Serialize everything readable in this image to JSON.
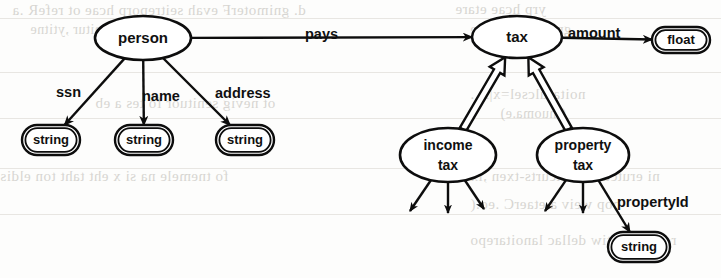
{
  "diagram": {
    "ink_color": "#0d0d0d",
    "paper_color": "#fdfdfc",
    "bleed_color": "#b9b6b0",
    "nodes": [
      {
        "id": "person",
        "label": "person",
        "shape": "ellipse",
        "kind": "entity",
        "cx": 143,
        "cy": 38,
        "rx": 48,
        "ry": 22
      },
      {
        "id": "tax",
        "label": "tax",
        "shape": "ellipse",
        "kind": "entity",
        "cx": 517,
        "cy": 37,
        "rx": 45,
        "ry": 21
      },
      {
        "id": "incometax",
        "label": "income tax",
        "shape": "ellipse",
        "kind": "entity",
        "cx": 448,
        "cy": 155,
        "rx": 48,
        "ry": 27
      },
      {
        "id": "propertytax",
        "label": "property tax",
        "shape": "ellipse",
        "kind": "entity",
        "cx": 583,
        "cy": 155,
        "rx": 46,
        "ry": 27
      },
      {
        "id": "float",
        "label": "float",
        "shape": "stadium",
        "kind": "basetype",
        "cx": 681,
        "cy": 40,
        "rx": 29,
        "ry": 13
      },
      {
        "id": "string1",
        "label": "string",
        "shape": "stadium",
        "kind": "basetype",
        "cx": 51,
        "cy": 140,
        "rx": 29,
        "ry": 15
      },
      {
        "id": "string2",
        "label": "string",
        "shape": "stadium",
        "kind": "basetype",
        "cx": 144,
        "cy": 140,
        "rx": 29,
        "ry": 15
      },
      {
        "id": "string3",
        "label": "string",
        "shape": "stadium",
        "kind": "basetype",
        "cx": 245,
        "cy": 140,
        "rx": 29,
        "ry": 15
      },
      {
        "id": "string4",
        "label": "string",
        "shape": "stadium",
        "kind": "basetype",
        "cx": 639,
        "cy": 247,
        "rx": 31,
        "ry": 15
      }
    ],
    "edges": [
      {
        "id": "pays",
        "label": "pays",
        "from": "person",
        "to": "tax",
        "style": "single",
        "label_x": 305,
        "label_y": 28
      },
      {
        "id": "amount",
        "label": "amount",
        "from": "tax",
        "to": "float",
        "style": "single",
        "label_x": 568,
        "label_y": 27
      },
      {
        "id": "ssn",
        "label": "ssn",
        "from": "person",
        "to": "string1",
        "style": "single",
        "label_x": 56,
        "label_y": 86
      },
      {
        "id": "name",
        "label": "name",
        "from": "person",
        "to": "string2",
        "style": "single",
        "label_x": 142,
        "label_y": 90
      },
      {
        "id": "address",
        "label": "address",
        "from": "person",
        "to": "string3",
        "style": "single",
        "label_x": 215,
        "label_y": 87
      },
      {
        "id": "propertyid",
        "label": "propertyId",
        "from": "propertytax",
        "to": "string4",
        "style": "single",
        "label_x": 617,
        "label_y": 196
      },
      {
        "id": "isa-income",
        "label": "",
        "from": "incometax",
        "to": "tax",
        "style": "double",
        "label_x": 0,
        "label_y": 0
      },
      {
        "id": "isa-property",
        "label": "",
        "from": "propertytax",
        "to": "tax",
        "style": "double",
        "label_x": 0,
        "label_y": 0
      }
    ],
    "dangling_edges": [
      {
        "id": "incometax-a",
        "from": "incometax",
        "dx": -38,
        "dy": 56
      },
      {
        "id": "incometax-b",
        "from": "incometax",
        "dx": 0,
        "dy": 58
      },
      {
        "id": "incometax-c",
        "from": "incometax",
        "dx": 36,
        "dy": 54
      },
      {
        "id": "propertytax-a",
        "from": "propertytax",
        "dx": -38,
        "dy": 56
      },
      {
        "id": "propertytax-b",
        "from": "propertytax",
        "dx": 0,
        "dy": 58
      }
    ],
    "background_text": {
      "b1": "d. gnimoterF evah seitreporp hcae ot refeR .a",
      "b2": "yrp hcae etare",
      "b3": "se gnitur ,ytitne",
      "b4": "gnidrocer ,ytitne",
      "b5": "ot nevig senituor fo tes a eb",
      "b6": "noitarulcsel=x|A .",
      "b7": "(tnuoma.e)",
      "b8": "fo tnemele na si x eht taht ton eldis",
      "b9": "ni erutcurts erutcurts-txen ,lx",
      "b10": "",
      "b11": "bop weiv a etaerC .eo.(",
      "b12": "ro detsil htiw dellac lanoitarepo"
    }
  }
}
